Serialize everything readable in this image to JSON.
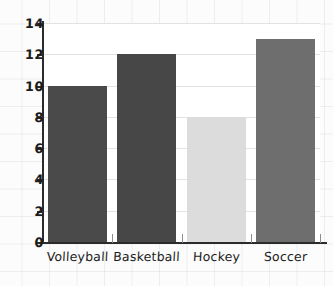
{
  "chart_data": {
    "type": "bar",
    "title": "",
    "subtitle": "",
    "xlabel": "",
    "ylabel": "",
    "categories": [
      "Volleyball",
      "Basketball",
      "Hockey",
      "Soccer"
    ],
    "values": [
      10,
      12,
      8,
      13
    ],
    "bar_colors": [
      "#4a4a4a",
      "#474747",
      "#dcdcdc",
      "#6e6e6e"
    ],
    "ylim": [
      0,
      14
    ],
    "ytick_labels": [
      "14",
      "12",
      "10",
      "8",
      "6",
      "4",
      "2",
      "0"
    ],
    "ytick_values": [
      14,
      12,
      10,
      8,
      6,
      4,
      2,
      0
    ],
    "grid": true,
    "grid_axis": "y",
    "legend": false,
    "legend_position": "none",
    "style": "hand-drawn",
    "annotations": []
  },
  "figure": {
    "background_color": "#fcfcfc",
    "plot_background_color": "#ffffff",
    "axis_color": "#2b2b2b",
    "gridline_color": "#e2e2e2",
    "paper_grid_color": "#788ca0"
  }
}
